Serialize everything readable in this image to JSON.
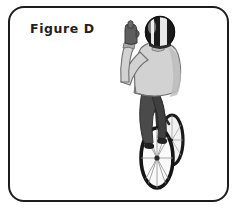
{
  "panel": {
    "label": "Figure D",
    "background_color": "#ffffff",
    "border_color": "#1c1c1c",
    "corner_radius_px": 16
  },
  "illustration": {
    "name": "cyclist-hand-signal-rear-view",
    "description": "Rear view of a bicycle rider with left arm raised and bent at the elbow, hand up, giving a turn hand signal",
    "subject": "bicyclist",
    "view": "from behind",
    "signal": "arm raised, bent at elbow, hand upright",
    "parts": [
      {
        "name": "helmet",
        "description": "oval helmet with black and white vertical panels"
      },
      {
        "name": "jacket",
        "description": "light gray long-sleeve jacket with darker waistband"
      },
      {
        "name": "raised-arm",
        "description": "left arm raised, elbow bent, forearm vertical"
      },
      {
        "name": "glove",
        "description": "dark gray glove on raised hand"
      },
      {
        "name": "pants",
        "description": "dark gray trousers"
      },
      {
        "name": "shoe",
        "description": "dark shoe on pedal"
      },
      {
        "name": "bicycle-rear-wheel",
        "description": "spoked wheel with black tire"
      },
      {
        "name": "bicycle-front-wheel",
        "description": "spoked wheel with black tire, partly hidden"
      },
      {
        "name": "bicycle-frame",
        "description": "dark bicycle frame and seat"
      }
    ],
    "colors": {
      "helmet_dark": "#1a1a1a",
      "helmet_light": "#e8e8e8",
      "jacket": "#d2d2d2",
      "jacket_shadow": "#b9b9b9",
      "jacket_band": "#8e8e8e",
      "glove": "#5e5e5e",
      "pants": "#4a4a4a",
      "pants_shadow": "#3a3a3a",
      "tire": "#1a1a1a",
      "spokes": "#9a9a9a",
      "outline": "#2b2b2b"
    }
  }
}
